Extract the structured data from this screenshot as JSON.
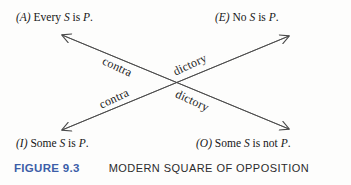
{
  "figure": {
    "propositions": [
      {
        "id": "A",
        "tag": "(A)",
        "text_before": " Every ",
        "subject": "S",
        "middle": " is ",
        "predicate": "P",
        "end": ".",
        "full": "(A) Every S is P."
      },
      {
        "id": "E",
        "tag": "(E)",
        "text_before": " No ",
        "subject": "S",
        "middle": " is ",
        "predicate": "P",
        "end": ".",
        "full": "(E) No S is P."
      },
      {
        "id": "I",
        "tag": "(I)",
        "text_before": " Some ",
        "subject": "S",
        "middle": " is ",
        "predicate": "P",
        "end": ".",
        "full": "(I) Some S is P."
      },
      {
        "id": "O",
        "tag": "(O)",
        "text_before": " Some ",
        "subject": "S",
        "middle": " is not ",
        "predicate": "P",
        "end": ".",
        "full": "(O) Some S is not P."
      }
    ],
    "relations": [
      {
        "id": "A-O",
        "word_start": "contra",
        "word_end": "dictory",
        "from": "A",
        "to": "O"
      },
      {
        "id": "E-I",
        "word_start": "contra",
        "word_end": "dictory",
        "from": "E",
        "to": "I"
      }
    ],
    "edge_labels": {
      "contra_top": "contra",
      "dictory_top": "dictory",
      "contra_bottom": "contra",
      "dictory_bottom": "dictory"
    },
    "caption": {
      "number": "FIGURE 9.3",
      "title": "MODERN SQUARE OF OPPOSITION",
      "number_color": "#3c5ea8"
    },
    "colors": {
      "ink": "#1a1a1a",
      "arrow": "#4a4a4a",
      "background": "#fdfdfc",
      "accent_blue": "#3c5ea8"
    }
  }
}
